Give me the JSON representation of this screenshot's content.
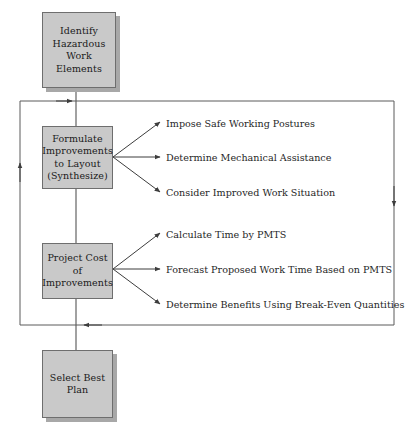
{
  "diagram": {
    "colors": {
      "box_fill": "#c9c9c9",
      "box_border": "#6e6e6e",
      "box_shadow": "#a8a8a8",
      "line": "#5a5a5a",
      "text": "#1a1a1a",
      "background": "#ffffff"
    },
    "nodes": [
      {
        "id": "identify-hazardous-work-elements",
        "label": "Identify\nHazardous\nWork\nElements",
        "x": 42,
        "y": 12,
        "width": 74,
        "height": 76,
        "shadow": true
      },
      {
        "id": "formulate-improvements",
        "label": "Formulate\nImprovements\nto Layout\n(Synthesize)",
        "x": 42,
        "y": 126,
        "width": 71,
        "height": 63,
        "shadow": false
      },
      {
        "id": "project-cost-of-improvements",
        "label": "Project Cost\nof\nImprovements",
        "x": 42,
        "y": 243,
        "width": 71,
        "height": 56,
        "shadow": false
      },
      {
        "id": "select-best-plan",
        "label": "Select Best\nPlan",
        "x": 42,
        "y": 350,
        "width": 71,
        "height": 68,
        "shadow": true
      }
    ],
    "branch_groups": [
      {
        "source": "formulate-improvements",
        "items": [
          {
            "id": "impose-safe-working-postures",
            "label": "Impose Safe Working Postures",
            "x": 166,
            "y": 118
          },
          {
            "id": "determine-mechanical-assistance",
            "label": "Determine Mechanical Assistance",
            "x": 166,
            "y": 152
          },
          {
            "id": "consider-improved-work-situation",
            "label": "Consider Improved Work Situation",
            "x": 166,
            "y": 187
          }
        ]
      },
      {
        "source": "project-cost-of-improvements",
        "items": [
          {
            "id": "calculate-time-by-pmts",
            "label": "Calculate Time by PMTS",
            "x": 166,
            "y": 229
          },
          {
            "id": "forecast-proposed-work-time",
            "label": "Forecast Proposed Work Time Based on PMTS",
            "x": 166,
            "y": 264
          },
          {
            "id": "determine-benefits-break-even",
            "label": "Determine Benefits Using Break-Even Quantities",
            "x": 166,
            "y": 299
          }
        ]
      }
    ],
    "connectors": [
      {
        "id": "trunk-identify-to-formulate",
        "type": "vertical-trunk"
      },
      {
        "id": "trunk-formulate-to-project",
        "type": "vertical-trunk"
      },
      {
        "id": "trunk-project-to-select",
        "type": "vertical-trunk"
      },
      {
        "id": "feedback-loop-outer",
        "type": "rectangular-feedback-loop"
      }
    ]
  }
}
